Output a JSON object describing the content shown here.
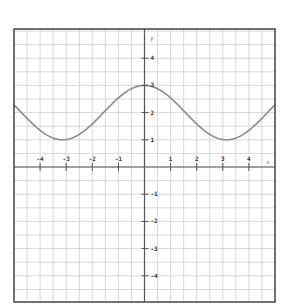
{
  "chart_data": {
    "type": "line",
    "title": "",
    "xlabel": "x",
    "ylabel": "y",
    "function": "y = 2 + cos(x)",
    "xlim": [
      -5,
      5
    ],
    "ylim": [
      -5,
      5
    ],
    "grid": true,
    "grid_step": 0.5,
    "x_ticks": [
      -4,
      -3,
      -2,
      -1,
      1,
      2,
      3,
      4
    ],
    "y_ticks": [
      -4,
      -3,
      -2,
      -1,
      1,
      2,
      3,
      4
    ],
    "x_tick_labels": [
      "-4",
      "-3",
      "-2",
      "-1",
      "1",
      "2",
      "3",
      "4"
    ],
    "y_tick_labels": [
      "-4",
      "-3",
      "-2",
      "-1",
      "1",
      "2",
      "3",
      "4"
    ],
    "series": [
      {
        "name": "curve",
        "x": [
          -5,
          -4.5,
          -4,
          -3.5,
          -3.14,
          -3,
          -2.5,
          -2,
          -1.5,
          -1,
          -0.5,
          0,
          0.5,
          1,
          1.5,
          2,
          2.5,
          3,
          3.14,
          3.5,
          4,
          4.5,
          5
        ],
        "values": [
          2.28,
          1.79,
          1.35,
          1.06,
          1.0,
          1.01,
          1.2,
          1.58,
          2.07,
          2.54,
          2.88,
          3.0,
          2.88,
          2.54,
          2.07,
          1.58,
          1.2,
          1.01,
          1.0,
          1.06,
          1.35,
          1.79,
          2.28
        ]
      }
    ],
    "legend": "none"
  },
  "axes": {
    "x_name": "x",
    "y_name": "y"
  },
  "colors": {
    "grid": "#cfcfcf",
    "axis": "#555555",
    "frame": "#444444",
    "curve": "#8a8a8a"
  }
}
